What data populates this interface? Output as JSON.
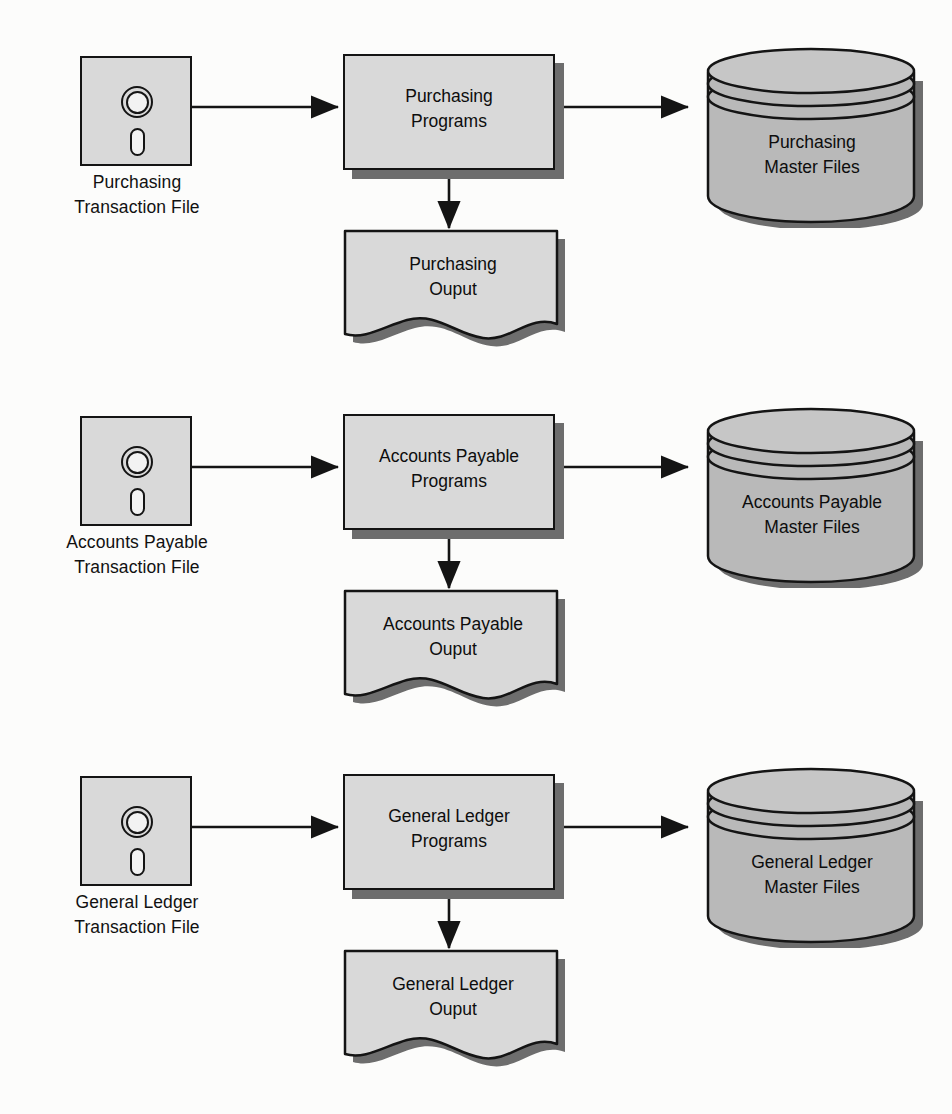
{
  "diagram": {
    "background_color": "#fcfcfb",
    "shape_fill": "#d9d9d9",
    "cylinder_fill": "#b9b9b9",
    "shadow_color": "#6d6d6d",
    "stroke_color": "#141414"
  },
  "rows": [
    {
      "id": "purchasing",
      "transaction_file": {
        "icon": "floppy-disk-icon",
        "label": "Purchasing\nTransaction File"
      },
      "process": {
        "label": "Purchasing\nPrograms"
      },
      "output": {
        "label": "Purchasing\nOuput"
      },
      "master_file": {
        "icon": "database-cylinder-icon",
        "label": "Purchasing\nMaster Files"
      }
    },
    {
      "id": "accounts-payable",
      "transaction_file": {
        "icon": "floppy-disk-icon",
        "label": "Accounts Payable\nTransaction File"
      },
      "process": {
        "label": "Accounts Payable\nPrograms"
      },
      "output": {
        "label": "Accounts Payable\nOuput"
      },
      "master_file": {
        "icon": "database-cylinder-icon",
        "label": "Accounts Payable\nMaster Files"
      }
    },
    {
      "id": "general-ledger",
      "transaction_file": {
        "icon": "floppy-disk-icon",
        "label": "General Ledger\nTransaction File"
      },
      "process": {
        "label": "General Ledger\nPrograms"
      },
      "output": {
        "label": "General Ledger\nOuput"
      },
      "master_file": {
        "icon": "database-cylinder-icon",
        "label": "General Ledger\nMaster Files"
      }
    }
  ]
}
